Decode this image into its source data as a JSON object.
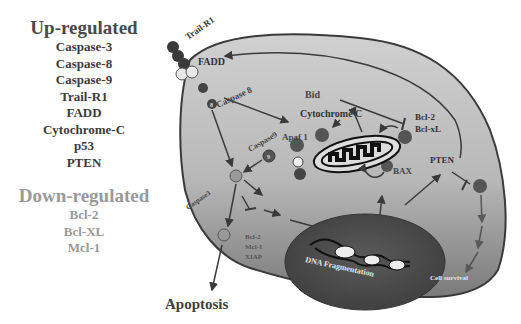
{
  "legend": {
    "up": {
      "title": "Up-regulated",
      "items": [
        "Caspase-3",
        "Caspase-8",
        "Caspase-9",
        "Trail-R1",
        "FADD",
        "Cytochrome-C",
        "p53",
        "PTEN"
      ]
    },
    "down": {
      "title": "Down-regulated",
      "items": [
        "Bcl-2",
        "Bcl-XL",
        "Mcl-1"
      ]
    }
  },
  "diagram": {
    "labels": {
      "trail_r1": "Trail-R1",
      "fadd": "FADD",
      "caspase8": "Caspase 8",
      "bid": "Bid",
      "cytochrome_c": "Cytochrome C",
      "bcl2": "Bcl-2",
      "bclxl": "Bcl-xL",
      "apaf1": "Apaf 1",
      "caspase9": "Caspase9",
      "bax": "BAX",
      "pten": "PTEN",
      "caspase3": "Caspase3",
      "inhibitors": [
        "Bcl-2",
        "Mcl-1",
        "XIAP"
      ],
      "dna_fragmentation": "DNA Fragmentation",
      "cell_survival": "Cell survival",
      "apoptosis": "Apoptosis",
      "pro": "Pro",
      "c9": "9",
      "c8": "8"
    },
    "colors": {
      "cell_fill": "#c4c4c4",
      "cell_dark": "#8e8e8e",
      "nucleus": "#555555",
      "outline": "#3a3a3a",
      "text_dark": "#404040",
      "text_light": "#e6e6e6"
    }
  }
}
